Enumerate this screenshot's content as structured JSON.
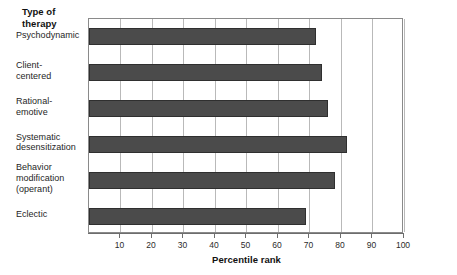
{
  "chart_data": {
    "type": "bar",
    "orientation": "horizontal",
    "title": "",
    "xlabel": "Percentile rank",
    "ylabel": "Type of\ntherapy",
    "ylabel_lines": [
      "Type of",
      "therapy"
    ],
    "categories": [
      "Psychodynamic",
      "Client-\ncentered",
      "Rational-\nemotive",
      "Systematic\ndesensitization",
      "Behavior\nmodification\n(operant)",
      "Eclectic"
    ],
    "category_lines": [
      [
        "Psychodynamic"
      ],
      [
        "Client-",
        "centered"
      ],
      [
        "Rational-",
        "emotive"
      ],
      [
        "Systematic",
        "desensitization"
      ],
      [
        "Behavior",
        "modification",
        "(operant)"
      ],
      [
        "Eclectic"
      ]
    ],
    "values": [
      72,
      74,
      76,
      82,
      78,
      69
    ],
    "xlim": [
      0,
      100
    ],
    "xticks": [
      10,
      20,
      30,
      40,
      50,
      60,
      70,
      80,
      90,
      100
    ],
    "xtick_labels": [
      "10",
      "20",
      "30",
      "40",
      "50",
      "60",
      "70",
      "80",
      "90",
      "100"
    ],
    "grid": true,
    "grid_axis": "x",
    "legend": false,
    "bar_color": "#4b4b4b",
    "bar_edge_color": "#2f2f2f",
    "gridline_color": "#b9b9b9",
    "axis_color": "#6d6d6d",
    "background_color": "#ffffff"
  }
}
